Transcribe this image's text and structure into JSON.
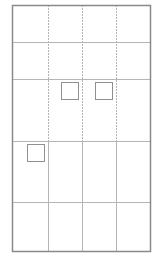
{
  "diagram": {
    "title": "",
    "colors": {
      "border": "#8a8a8a",
      "grid": "#b5b5b5",
      "square": "#8f8f8f",
      "background": "#ffffff"
    },
    "frame": {
      "x": 12,
      "y": 5,
      "width": 138,
      "height": 246
    },
    "columns_x": [
      12,
      48,
      82,
      116,
      150
    ],
    "rows_y": [
      5,
      42,
      79,
      141,
      202,
      251
    ],
    "squares": [
      {
        "x": 61,
        "y": 82,
        "size": 17
      },
      {
        "x": 95,
        "y": 82,
        "size": 17
      },
      {
        "x": 27,
        "y": 144,
        "size": 17
      }
    ]
  }
}
